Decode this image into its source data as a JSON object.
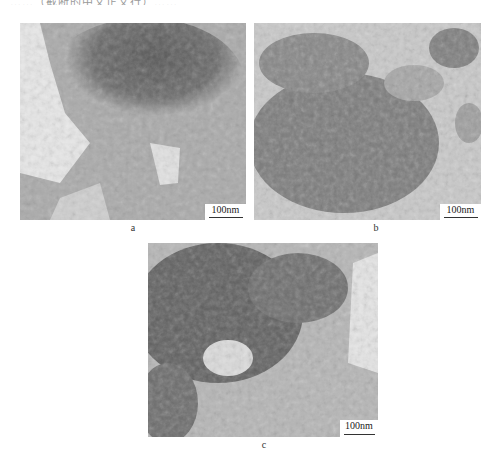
{
  "page": {
    "top_text_fragment": "……（截断的中文正文行）……",
    "type": "TEM micrograph figure"
  },
  "figure": {
    "panels": [
      {
        "id": "a",
        "label": "a",
        "scale_bar": "100nm",
        "description": "Dense dark agglomerate at top with lighter curly sheet-like structures below"
      },
      {
        "id": "b",
        "label": "b",
        "scale_bar": "100nm",
        "description": "Clustered curly nanostructure aggregates scattered across light background"
      },
      {
        "id": "c",
        "label": "c",
        "scale_bar": "100nm",
        "description": "Dark dense region upper-left with lighter wrinkled sheets lower-right"
      }
    ]
  },
  "colors": {
    "background": "#ffffff",
    "micrograph_dark": "#5a5a5a",
    "micrograph_mid": "#8e8e8e",
    "micrograph_light": "#d6d6d6"
  }
}
